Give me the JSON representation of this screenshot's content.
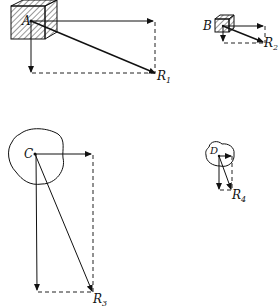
{
  "figure": {
    "colors": {
      "ink": "#111111",
      "background": "#ffffff"
    },
    "bodies": [
      {
        "id": "A",
        "label": "A",
        "shape": "hatched-cube",
        "resultant": "R",
        "resultant_sub": "1"
      },
      {
        "id": "B",
        "label": "B",
        "shape": "hatched-cube",
        "resultant": "R",
        "resultant_sub": "2"
      },
      {
        "id": "C",
        "label": "C",
        "shape": "irregular-blob",
        "resultant": "R",
        "resultant_sub": "3"
      },
      {
        "id": "D",
        "label": "D",
        "shape": "irregular-blob",
        "resultant": "R",
        "resultant_sub": "4"
      }
    ]
  }
}
